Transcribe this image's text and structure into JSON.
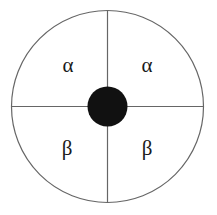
{
  "figure": {
    "background_color": "#ffffff",
    "width": 217,
    "height": 215
  },
  "outer_circle": {
    "name": "outer-circle",
    "center_x": 107.5,
    "center_y": 106.5,
    "radius": 96,
    "stroke_color": "#666666",
    "stroke_width": 1.2,
    "fill": "none"
  },
  "divider_lines": [
    {
      "name": "vertical-divider",
      "orientation": "vertical",
      "x1": 107.5,
      "y1": 10.5,
      "x2": 107.5,
      "y2": 202.5,
      "stroke_color": "#666666",
      "stroke_width": 1.2
    },
    {
      "name": "horizontal-divider",
      "orientation": "horizontal",
      "x1": 11.5,
      "y1": 106.5,
      "x2": 203.5,
      "y2": 106.5,
      "stroke_color": "#666666",
      "stroke_width": 1.2
    }
  ],
  "hub_circle": {
    "name": "center-hub",
    "center_x": 107.5,
    "center_y": 106.5,
    "radius": 20,
    "fill_color": "#111111",
    "stroke": "none"
  },
  "quadrant_labels": [
    {
      "id": "top-left",
      "text": "α",
      "symbol_name": "alpha",
      "x": 68,
      "y": 65
    },
    {
      "id": "top-right",
      "text": "α",
      "symbol_name": "alpha",
      "x": 147,
      "y": 65
    },
    {
      "id": "bottom-left",
      "text": "β",
      "symbol_name": "beta",
      "x": 67,
      "y": 148
    },
    {
      "id": "bottom-right",
      "text": "β",
      "symbol_name": "beta",
      "x": 147,
      "y": 148
    }
  ]
}
